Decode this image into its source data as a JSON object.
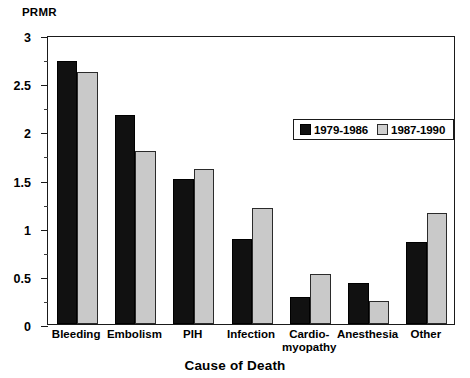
{
  "chart_data": {
    "type": "bar",
    "title": "",
    "xlabel": "Cause of Death",
    "ylabel": "PRMR",
    "ylim": [
      0,
      3
    ],
    "ytick_labels": [
      "0",
      "0.5",
      "1",
      "1.5",
      "2",
      "2.5",
      "3"
    ],
    "ytick_values": [
      0,
      0.5,
      1,
      1.5,
      2,
      2.5,
      3
    ],
    "yminor_values": [
      0.25,
      0.75,
      1.25,
      1.75,
      2.25,
      2.75
    ],
    "grid": false,
    "legend_position": "upper right inside",
    "categories": [
      "Bleeding",
      "Embolism",
      "PIH",
      "Infection",
      "Cardio-myopathy",
      "Anesthesia",
      "Other"
    ],
    "category_label_lines": [
      [
        "Bleeding"
      ],
      [
        "Embolism"
      ],
      [
        "PIH"
      ],
      [
        "Infection"
      ],
      [
        "Cardio-",
        "myopathy"
      ],
      [
        "Anesthesia"
      ],
      [
        "Other"
      ]
    ],
    "series": [
      {
        "name": "1979-1986",
        "color": "#111111",
        "values": [
          2.73,
          2.17,
          1.51,
          0.88,
          0.28,
          0.43,
          0.85
        ]
      },
      {
        "name": "1987-1990",
        "color": "#c9c9c9",
        "values": [
          2.62,
          1.8,
          1.61,
          1.2,
          0.52,
          0.24,
          1.15
        ]
      }
    ]
  },
  "legend": {
    "entries": [
      {
        "label": "1979-1986",
        "swatch": "black-square-swatch"
      },
      {
        "label": "1987-1990",
        "swatch": "gray-square-swatch"
      }
    ]
  },
  "axes": {
    "y_unit_label": "PRMR",
    "x_title": "Cause of Death"
  }
}
